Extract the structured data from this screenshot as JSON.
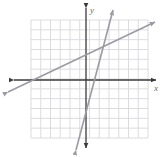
{
  "figure": {
    "name": "coordinate-plane-two-lines",
    "width": 164,
    "height": 157,
    "background_color": "#ffffff"
  },
  "chart_data": {
    "type": "line",
    "title": "",
    "xlabel": "x",
    "ylabel": "y",
    "grid": true,
    "legend": null,
    "axis_style": {
      "color": "#3a3a3a",
      "arrowheads_both_ends": true,
      "tick_labels": false
    },
    "grid_style": {
      "color": "#d8d8dc",
      "cell_px": 9.8,
      "columns": 12,
      "rows": 12,
      "left_px": 31,
      "top_px": 20,
      "right_px": 148,
      "bottom_px": 138
    },
    "origin_px": {
      "x": 86,
      "y": 80
    },
    "unit_px": 9.8,
    "xlim": [
      -5.6,
      6.3
    ],
    "ylim": [
      -5.9,
      6.1
    ],
    "series": [
      {
        "name": "shallow-line",
        "color": "#9b9ba3",
        "slope": 0.5,
        "intercept": 2.45,
        "x_intercept": -4.9,
        "y_intercept": 2.45,
        "points_px": [
          [
            8,
            92
          ],
          [
            155,
            22
          ]
        ],
        "arrowheads": [
          "start",
          "end"
        ]
      },
      {
        "name": "steep-line",
        "color": "#9b9ba3",
        "slope": 3.8,
        "intercept": -1.15,
        "x_intercept": 0.3,
        "y_intercept": -1.15,
        "points_px": [
          [
            76,
            150
          ],
          [
            113,
            10
          ]
        ],
        "arrowheads": [
          "start",
          "end"
        ]
      }
    ],
    "intersection_px": {
      "x": 103,
      "y": 48
    },
    "intersection": {
      "x": 1.75,
      "y": 3.3
    }
  },
  "labels": {
    "x_axis": "x",
    "y_axis": "y"
  },
  "colors": {
    "grid": "#d8d8dc",
    "axis": "#3a3a3a",
    "line": "#9b9ba3",
    "label": "#6a6a6a",
    "background": "#ffffff"
  }
}
